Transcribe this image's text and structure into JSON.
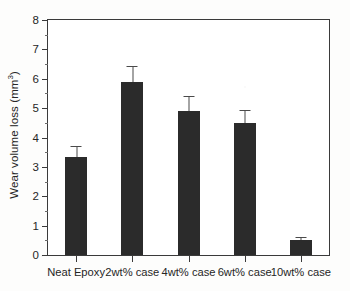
{
  "chart_data": {
    "type": "bar",
    "title": "",
    "subtitle": "",
    "xlabel": "",
    "ylabel": "Wear volume loss (mm3)",
    "ylabel_base": "Wear volume loss (mm",
    "ylabel_exp": "3",
    "ylabel_tail": ")",
    "categories": [
      "Neat Epoxy",
      "2wt% case",
      "4wt% case",
      "6wt% case",
      "10wt% case"
    ],
    "values": [
      3.35,
      5.9,
      4.9,
      4.5,
      0.5
    ],
    "errors": [
      0.35,
      0.55,
      0.5,
      0.45,
      0.1
    ],
    "ylim": [
      0,
      8
    ],
    "ytick_labels": [
      "0",
      "1",
      "2",
      "3",
      "4",
      "5",
      "6",
      "7",
      "8"
    ],
    "ytick_values": [
      0,
      1,
      2,
      3,
      4,
      5,
      6,
      7,
      8
    ],
    "yminor_values": [
      0.5,
      1.5,
      2.5,
      3.5,
      4.5,
      5.5,
      6.5,
      7.5
    ],
    "grid": false,
    "legend": false,
    "legend_position": "none",
    "bar_color": "#2b2b2b",
    "error_color": "#4a4a4a",
    "axis_color": "#3a3a3a",
    "background_color": "#ffffff",
    "bar_width_px": 22,
    "error_bar_style": "upper-only-cap"
  }
}
